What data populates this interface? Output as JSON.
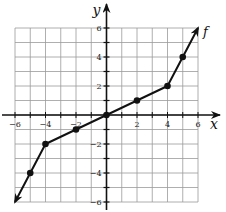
{
  "chart_data": {
    "type": "line",
    "title": "",
    "xlabel": "x",
    "ylabel": "y",
    "function_label": "f",
    "xlim": [
      -6,
      6
    ],
    "ylim": [
      -6,
      6
    ],
    "grid": true,
    "grid_step": 1,
    "x_tick_labels": [
      "-6",
      "-4",
      "-2",
      "2",
      "4",
      "6"
    ],
    "x_tick_values": [
      -6,
      -4,
      -2,
      2,
      4,
      6
    ],
    "y_tick_labels": [
      "6",
      "4",
      "2",
      "-2",
      "-4",
      "-6"
    ],
    "y_tick_values": [
      6,
      4,
      2,
      -2,
      -4,
      -6
    ],
    "series": [
      {
        "name": "f",
        "x": [
          -6,
          -5,
          -4,
          -2,
          0,
          2,
          4,
          5,
          6
        ],
        "y": [
          -6,
          -4,
          -2,
          -1,
          0,
          1,
          2,
          4,
          6
        ],
        "marked_points": [
          [
            -5,
            -4
          ],
          [
            -4,
            -2
          ],
          [
            -2,
            -1
          ],
          [
            0,
            0
          ],
          [
            2,
            1
          ],
          [
            4,
            2
          ],
          [
            5,
            4
          ]
        ],
        "arrow_ends": [
          [
            -6,
            -6
          ],
          [
            6,
            6
          ]
        ]
      }
    ]
  },
  "colors": {
    "grid": "#9a9a9a",
    "axis": "#111111",
    "line": "#111111",
    "background": "#ffffff"
  }
}
